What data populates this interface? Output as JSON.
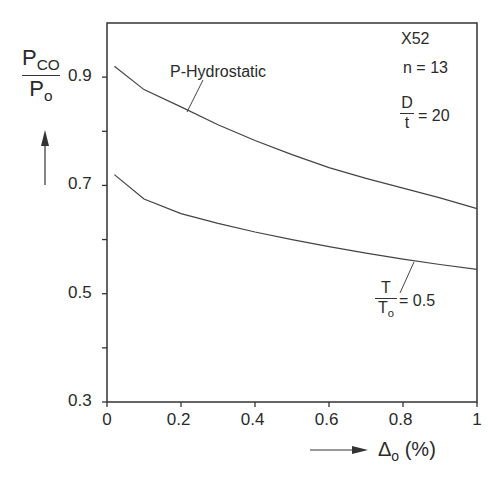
{
  "chart_data": {
    "type": "line",
    "title": "",
    "xlabel": "Δo (%)",
    "ylabel": "PCO / Po",
    "xlim": [
      0,
      1
    ],
    "ylim": [
      0.3,
      1.0
    ],
    "x_ticks": [
      "0",
      "0.2",
      "0.4",
      "0.6",
      "0.8",
      "1"
    ],
    "y_ticks": [
      "0.3",
      "0.5",
      "0.7",
      "0.9"
    ],
    "grid": false,
    "series": [
      {
        "name": "P-Hydrostatic",
        "x": [
          0.02,
          0.1,
          0.2,
          0.3,
          0.4,
          0.5,
          0.6,
          0.7,
          0.8,
          0.9,
          1.0
        ],
        "values": [
          0.92,
          0.877,
          0.845,
          0.812,
          0.783,
          0.757,
          0.733,
          0.713,
          0.695,
          0.677,
          0.657
        ]
      },
      {
        "name": "T/To = 0.5",
        "x": [
          0.02,
          0.1,
          0.2,
          0.3,
          0.4,
          0.5,
          0.6,
          0.7,
          0.8,
          0.9,
          1.0
        ],
        "values": [
          0.72,
          0.675,
          0.648,
          0.63,
          0.614,
          0.6,
          0.587,
          0.575,
          0.564,
          0.554,
          0.545
        ]
      }
    ],
    "annotations": [
      "X52",
      "n = 13",
      "D/t = 20",
      "P-Hydrostatic",
      "T/To = 0.5"
    ]
  },
  "labels": {
    "y_num": "P",
    "y_num_sub": "CO",
    "y_den": "P",
    "y_den_sub": "o",
    "x_delta": "Δ",
    "x_sub": "o",
    "x_unit": " (%)",
    "material": "X52",
    "n_param": "n = 13",
    "dt_num": "D",
    "dt_den": "t",
    "dt_val": "= 20",
    "curve1": "P-Hydrostatic",
    "curve2_num": "T",
    "curve2_den": "T",
    "curve2_den_sub": "o",
    "curve2_val": "= 0.5"
  }
}
